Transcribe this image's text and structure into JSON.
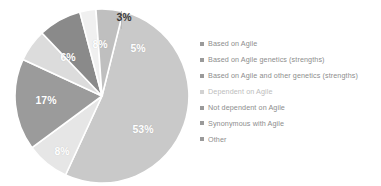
{
  "chart_data": {
    "type": "pie",
    "title": "",
    "subtitle": "",
    "xlabel": "",
    "ylabel": "",
    "grid": false,
    "legend_position": "right",
    "categories": [
      "Based on Agile",
      "Based on Agile genetics (strengths)",
      "Based on Agile and other genetics (strengths)",
      "Dependent on Agile",
      "Not dependent on Agile",
      "Synonymous with Agile",
      "Other"
    ],
    "values": [
      53,
      8,
      17,
      6,
      8,
      3,
      5
    ],
    "value_labels": [
      "53%",
      "8%",
      "17%",
      "6%",
      "8%",
      "3%",
      "5%"
    ],
    "colors": [
      "#c9c9c9",
      "#e6e6e6",
      "#9b9b9b",
      "#dcdcdc",
      "#8a8a8a",
      "#f0f0f0",
      "#bfbfbf"
    ],
    "units": "percent"
  },
  "pie": {
    "labels": [
      {
        "text": "53%",
        "x": 129,
        "y": 121,
        "placement": "inside"
      },
      {
        "text": "8%",
        "x": 48,
        "y": 143,
        "placement": "inside"
      },
      {
        "text": "17%",
        "x": 32,
        "y": 92,
        "placement": "inside"
      },
      {
        "text": "6%",
        "x": 54,
        "y": 49,
        "placement": "inside"
      },
      {
        "text": "8%",
        "x": 86,
        "y": 36,
        "placement": "inside"
      },
      {
        "text": "3%",
        "x": 110,
        "y": 9,
        "placement": "outside"
      },
      {
        "text": "5%",
        "x": 124,
        "y": 40,
        "placement": "inside"
      }
    ]
  },
  "legend": {
    "items": [
      {
        "label": "Based on Agile",
        "color": "#9a9a9a",
        "faded": false
      },
      {
        "label": "Based on Agile genetics (strengths)",
        "color": "#9a9a9a",
        "faded": false
      },
      {
        "label": "Based on Agile and other genetics (strengths)",
        "color": "#9a9a9a",
        "faded": false
      },
      {
        "label": "Dependent on Agile",
        "color": "#d2d2d2",
        "faded": true
      },
      {
        "label": "Not dependent on Agile",
        "color": "#9a9a9a",
        "faded": false
      },
      {
        "label": "Synonymous with Agile",
        "color": "#9a9a9a",
        "faded": false
      },
      {
        "label": "Other",
        "color": "#9a9a9a",
        "faded": false
      }
    ]
  }
}
